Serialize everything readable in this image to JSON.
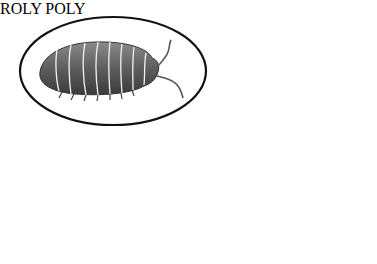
{
  "illustration": {
    "label": "ROLY POLY",
    "colors": {
      "background": "#ffffff",
      "outline": "#111111",
      "dark_bug_fill": "#6f6f6f",
      "dark_bug_shade": "#3c3c3c",
      "light_bug_fill": "#d8d8d8",
      "light_bug_shade": "#9a9a9a",
      "segment_line": "#f4f4f4"
    },
    "figures": [
      {
        "name": "dark-roly-poly-large",
        "in_ellipse": true
      },
      {
        "name": "dark-roly-poly-small"
      },
      {
        "name": "light-roly-poly-large",
        "in_ellipse": true
      },
      {
        "name": "light-roly-poly-small"
      }
    ]
  }
}
